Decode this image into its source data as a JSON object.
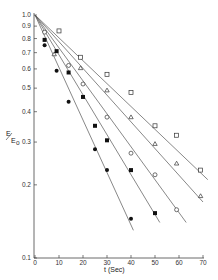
{
  "chart_data": {
    "type": "scatter",
    "title": "",
    "xlabel": "t (Sec)",
    "ylabel": "E/Eo",
    "xlim": [
      0,
      70
    ],
    "ylim": [
      0.1,
      1.0
    ],
    "yscale": "log",
    "grid": false,
    "legend": "none",
    "x_ticks": [
      0,
      10,
      20,
      30,
      40,
      50,
      60,
      70
    ],
    "x_tick_labels": [
      "0",
      "10",
      "20",
      "30",
      "40",
      "50",
      "60",
      "70"
    ],
    "y_ticks": [
      1.0,
      0.9,
      0.8,
      0.7,
      0.6,
      0.5,
      0.4,
      0.3,
      0.2,
      0.1
    ],
    "y_tick_labels": [
      "1.0",
      "0.9",
      "0.8",
      "0.7",
      "0.6",
      "0.5",
      "0.4",
      "0.3",
      "0.2",
      "0.1"
    ],
    "series": [
      {
        "name": "open squares",
        "marker": "open-square",
        "x": [
          10,
          19,
          30,
          40,
          50,
          59,
          69
        ],
        "y": [
          0.86,
          0.67,
          0.57,
          0.48,
          0.35,
          0.32,
          0.23
        ],
        "fit_line": {
          "x": [
            0,
            72
          ],
          "y": [
            1.0,
            0.21
          ]
        }
      },
      {
        "name": "open triangles",
        "marker": "open-triangle",
        "x": [
          8,
          19,
          30,
          40,
          50,
          59,
          69
        ],
        "y": [
          0.69,
          0.605,
          0.49,
          0.38,
          0.295,
          0.245,
          0.18
        ],
        "fit_line": {
          "x": [
            0,
            70
          ],
          "y": [
            1.0,
            0.17
          ]
        }
      },
      {
        "name": "open circles",
        "marker": "open-circle",
        "x": [
          4,
          14,
          20,
          30,
          40,
          50,
          59
        ],
        "y": [
          0.85,
          0.62,
          0.52,
          0.38,
          0.27,
          0.22,
          0.158
        ],
        "fit_line": {
          "x": [
            0,
            63
          ],
          "y": [
            1.0,
            0.14
          ]
        }
      },
      {
        "name": "filled squares",
        "marker": "filled-square",
        "x": [
          4,
          9,
          14,
          20,
          25,
          30,
          40,
          50
        ],
        "y": [
          0.79,
          0.71,
          0.58,
          0.46,
          0.35,
          0.305,
          0.23,
          0.153
        ],
        "fit_line": {
          "x": [
            0,
            52
          ],
          "y": [
            1.0,
            0.14
          ]
        }
      },
      {
        "name": "filled circles",
        "marker": "filled-circle",
        "x": [
          4,
          9,
          14,
          25,
          30,
          40
        ],
        "y": [
          0.75,
          0.59,
          0.44,
          0.28,
          0.23,
          0.145
        ],
        "fit_line": {
          "x": [
            0,
            41
          ],
          "y": [
            1.0,
            0.13
          ]
        }
      }
    ]
  },
  "labels": {
    "y_axis_numerator": "E",
    "y_axis_denominator": "E",
    "y_axis_subscript": "o",
    "x_axis": "t (Sec)"
  }
}
